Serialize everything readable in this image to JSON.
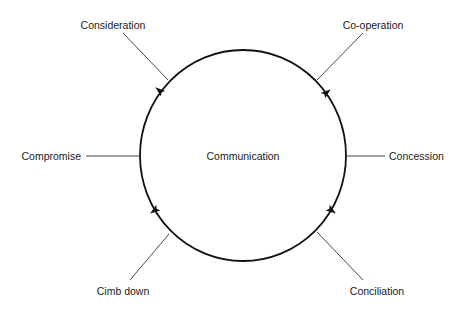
{
  "diagram": {
    "center": {
      "label": "Communication",
      "x": 243,
      "y": 160
    },
    "ring": {
      "cx": 243,
      "cy": 155.5,
      "rx": 103,
      "ry": 105.5,
      "direction": "clockwise",
      "color": "#111111"
    },
    "nodes": [
      {
        "id": "consideration",
        "label": "Consideration",
        "text_x": 113,
        "text_y": 29,
        "anchor": "middle",
        "line": [
          123,
          33,
          168,
          80
        ]
      },
      {
        "id": "co-operation",
        "label": "Co-operation",
        "text_x": 373,
        "text_y": 29,
        "anchor": "middle",
        "line": [
          363,
          33,
          317,
          80
        ]
      },
      {
        "id": "concession",
        "label": "Concession",
        "text_x": 389,
        "text_y": 160,
        "anchor": "start",
        "line": [
          346,
          156,
          385,
          156
        ]
      },
      {
        "id": "conciliation",
        "label": "Conciliation",
        "text_x": 377,
        "text_y": 295,
        "anchor": "middle",
        "line": [
          317,
          232,
          363,
          280
        ]
      },
      {
        "id": "climb-down",
        "label": "Cimb down",
        "text_x": 123,
        "text_y": 295,
        "anchor": "middle",
        "line": [
          169,
          234,
          130,
          280
        ]
      },
      {
        "id": "compromise",
        "label": "Compromise",
        "text_x": 81,
        "text_y": 160,
        "anchor": "end",
        "line": [
          86,
          156,
          140,
          156
        ]
      }
    ],
    "arrows": [
      {
        "position": "top-left",
        "x": 160,
        "y": 91,
        "angle": -50
      },
      {
        "position": "top-right",
        "x": 326,
        "y": 93,
        "angle": 50
      },
      {
        "position": "bottom-right",
        "x": 331,
        "y": 210,
        "angle": 125
      },
      {
        "position": "bottom-left",
        "x": 155,
        "y": 210,
        "angle": -125
      }
    ]
  }
}
